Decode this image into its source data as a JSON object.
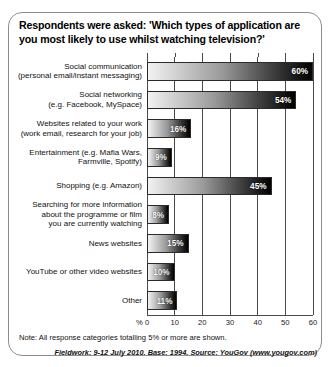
{
  "title": "Respondents were asked: 'Which types of application are you most likely to use whilst watching television?'",
  "footer": {
    "note": "Note: All response categories totalling 5% or more are shown.",
    "source": "Fieldwork: 9-12 July 2010. Base: 1994. Source: YouGov (www.yougov.com)"
  },
  "chart_data": {
    "type": "bar",
    "orientation": "horizontal",
    "title": "Respondents were asked: 'Which types of application are you most likely to use whilst watching television?'",
    "xlabel": "%",
    "ylabel": "",
    "xlim": [
      0,
      60
    ],
    "xticks": [
      0,
      10,
      20,
      30,
      40,
      50,
      60
    ],
    "xtick_labels": [
      "0",
      "10",
      "20",
      "30",
      "40",
      "50",
      "60"
    ],
    "grid": true,
    "legend": "none",
    "categories": [
      "Social communication (personal email/instant messaging)",
      "Social networking (e.g. Facebook, MySpace)",
      "Websites related to your work (work email, research for your job)",
      "Entertainment (e.g. Mafia Wars, Farmville, Spotify)",
      "Shopping (e.g. Amazon)",
      "Searching for more information about the programme or film you are currently watching",
      "News websites",
      "YouTube or other video websites",
      "Other"
    ],
    "category_lines": [
      [
        "Social communication",
        "(personal email/instant messaging)"
      ],
      [
        "Social networking",
        "(e.g. Facebook, MySpace)"
      ],
      [
        "Websites related to your work",
        "(work email, research for your job)"
      ],
      [
        "Entertainment (e.g. Mafia Wars,",
        "Farmville, Spotify)"
      ],
      [
        "Shopping (e.g. Amazon)"
      ],
      [
        "Searching for more information",
        "about the programme or film",
        "you are currently watching"
      ],
      [
        "News websites"
      ],
      [
        "YouTube or other video websites"
      ],
      [
        "Other"
      ]
    ],
    "values": [
      60,
      54,
      16,
      9,
      45,
      8,
      15,
      10,
      11
    ],
    "value_labels": [
      "60%",
      "54%",
      "16%",
      "9%",
      "45%",
      "8%",
      "15%",
      "10%",
      "11%"
    ]
  }
}
